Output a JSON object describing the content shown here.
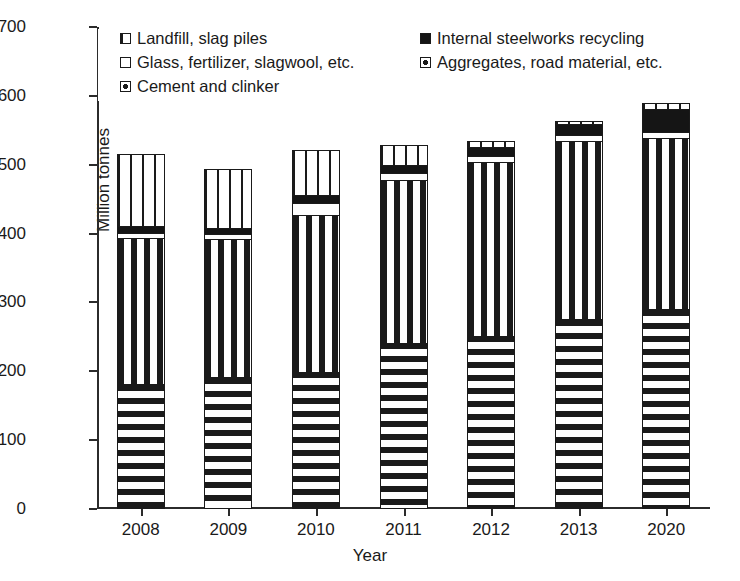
{
  "chart_data": {
    "type": "bar",
    "subtype": "stacked-bar",
    "title": "",
    "xlabel": "Year",
    "ylabel": "Million tonnes",
    "ylim": [
      0,
      700
    ],
    "ytick_step": 100,
    "yticks": [
      "700",
      "600",
      "500",
      "400",
      "300",
      "200",
      "100",
      "0"
    ],
    "grid": false,
    "legend_position": "inside-top-left",
    "categories": [
      "2008",
      "2009",
      "2010",
      "2011",
      "2012",
      "2013",
      "2020"
    ],
    "series": [
      {
        "name": "Cement and clinker",
        "pattern": "vertical-dashes",
        "values": [
          180,
          190,
          198,
          240,
          250,
          274,
          289
        ]
      },
      {
        "name": "Aggregates, road material, etc.",
        "pattern": "horizontal-dashes",
        "values": [
          212,
          200,
          227,
          237,
          252,
          259,
          249
        ]
      },
      {
        "name": "Glass, fertilizer, slagwool, etc.",
        "pattern": "white",
        "values": [
          8,
          8,
          18,
          9,
          9,
          8,
          8
        ]
      },
      {
        "name": "Internal steelworks recycling",
        "pattern": "solid-black",
        "values": [
          9,
          9,
          11,
          12,
          14,
          17,
          34
        ]
      },
      {
        "name": "Landfill, slag piles",
        "pattern": "vertical-stripes",
        "values": [
          104,
          85,
          66,
          29,
          8,
          3,
          7
        ]
      }
    ],
    "totals": [
      513,
      492,
      520,
      527,
      533,
      561,
      587
    ]
  },
  "legend": {
    "rows": [
      [
        {
          "label": "Landfill, slag piles",
          "swatch": "vertical-stripes"
        },
        {
          "label": "Internal steelworks recycling",
          "swatch": "solid-black"
        }
      ],
      [
        {
          "label": "Glass, fertilizer, slagwool, etc.",
          "swatch": "white"
        },
        {
          "label": "Aggregates, road material, etc.",
          "swatch": "horizontal-dashes"
        }
      ],
      [
        {
          "label": "Cement and clinker",
          "swatch": "vertical-dashes"
        }
      ]
    ]
  }
}
